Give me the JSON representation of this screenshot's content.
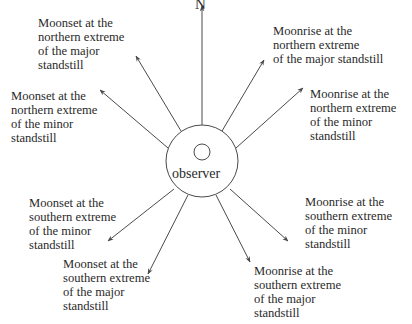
{
  "diagram": {
    "north_label": "N",
    "observer_label": "observer",
    "colors": {
      "line": "#4a4a4a",
      "text": "#2a2a2a",
      "background": "#ffffff"
    },
    "center": {
      "x": 202,
      "y": 161,
      "r": 36,
      "inner_r": 8
    },
    "labels": {
      "nw_major": "Moonset at the\nnorthern extreme\nof the major\nstandstill",
      "nw_minor": "Moonset at the\nnorthern extreme\nof the minor\nstandstill",
      "ne_major": "Moonrise at the\nnorthern extreme\nof the major standstill",
      "ne_minor": "Moonrise at the\nnorthern extreme\nof the minor\nstandstill",
      "sw_minor": "Moonset at the\nsouthern extreme\nof the minor\nstandstill",
      "sw_major": "Moonset at the\nsouthern extreme\nof the major\nstandstill",
      "se_minor": "Moonrise at the\nsouthern extreme\nof the minor\nstandstill",
      "se_major": "Moonrise at the\nsouthern extreme\nof the major\nstandstill"
    },
    "arrows": [
      {
        "name": "north",
        "x1": 202,
        "y1": 125,
        "x2": 202,
        "y2": 6
      },
      {
        "name": "nw_major",
        "x1": 181,
        "y1": 131,
        "x2": 136,
        "y2": 56
      },
      {
        "name": "nw_minor",
        "x1": 168,
        "y1": 148,
        "x2": 100,
        "y2": 90
      },
      {
        "name": "ne_major",
        "x1": 222,
        "y1": 131,
        "x2": 264,
        "y2": 60
      },
      {
        "name": "ne_minor",
        "x1": 236,
        "y1": 148,
        "x2": 303,
        "y2": 88
      },
      {
        "name": "sw_minor",
        "x1": 174,
        "y1": 189,
        "x2": 108,
        "y2": 241
      },
      {
        "name": "sw_major",
        "x1": 188,
        "y1": 195,
        "x2": 148,
        "y2": 274
      },
      {
        "name": "se_minor",
        "x1": 230,
        "y1": 189,
        "x2": 288,
        "y2": 241
      },
      {
        "name": "se_major",
        "x1": 216,
        "y1": 195,
        "x2": 250,
        "y2": 262
      }
    ]
  }
}
